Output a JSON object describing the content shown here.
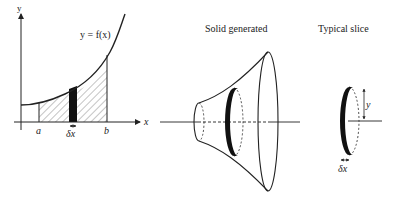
{
  "graph": {
    "y_axis_label": "y",
    "x_axis_label": "x",
    "curve_label": "y = f(x)",
    "a_label": "a",
    "b_label": "b",
    "dx_label": "δx"
  },
  "solid": {
    "title": "Solid generated"
  },
  "slice": {
    "title": "Typical slice",
    "radius_label": "y",
    "dx_label": "δx"
  },
  "colors": {
    "stroke": "#222222",
    "background": "#ffffff"
  }
}
